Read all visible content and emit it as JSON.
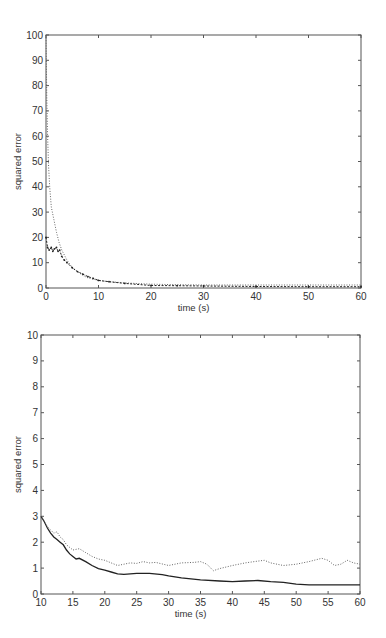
{
  "chart_data": [
    {
      "type": "line",
      "title": "",
      "xlabel": "time (s)",
      "ylabel": "squared error",
      "xlim": [
        0,
        60
      ],
      "ylim": [
        0,
        100
      ],
      "xticks": [
        0,
        10,
        20,
        30,
        40,
        50,
        60
      ],
      "yticks": [
        0,
        10,
        20,
        30,
        40,
        50,
        60,
        70,
        80,
        90,
        100
      ],
      "grid": false,
      "legend": null,
      "series": [
        {
          "name": "dotted",
          "style": "dotted",
          "x": [
            0,
            0.15,
            0.3,
            0.5,
            0.7,
            1,
            1.5,
            2,
            2.5,
            3,
            4,
            5,
            6,
            7,
            8,
            10,
            12,
            15,
            20,
            25,
            30,
            40,
            50,
            60
          ],
          "y": [
            100,
            75,
            60,
            48,
            40,
            32,
            27,
            22,
            18,
            15,
            11,
            8,
            6.5,
            5,
            4,
            3,
            2.5,
            2,
            1.5,
            1.3,
            1.2,
            1.2,
            1.2,
            1.2
          ]
        },
        {
          "name": "solid-markers",
          "style": "solid-markers",
          "x": [
            0,
            0.3,
            0.6,
            1,
            1.3,
            1.6,
            2,
            2.3,
            2.6,
            3,
            3.5,
            4,
            5,
            6,
            7,
            8,
            9,
            10,
            12,
            15,
            20,
            25,
            30,
            40,
            50,
            60
          ],
          "y": [
            20,
            16,
            15,
            16,
            14.5,
            15.5,
            16,
            14.5,
            15,
            12.5,
            11,
            10,
            8,
            6.5,
            5.5,
            4.5,
            3.8,
            3,
            2.5,
            1.8,
            1,
            0.9,
            0.8,
            0.6,
            0.5,
            0.5
          ]
        }
      ]
    },
    {
      "type": "line",
      "title": "",
      "xlabel": "time (s)",
      "ylabel": "squared error",
      "xlim": [
        10,
        60
      ],
      "ylim": [
        0,
        10
      ],
      "xticks": [
        10,
        15,
        20,
        25,
        30,
        35,
        40,
        45,
        50,
        55,
        60
      ],
      "yticks": [
        0,
        1,
        2,
        3,
        4,
        5,
        6,
        7,
        8,
        9,
        10
      ],
      "grid": false,
      "legend": null,
      "series": [
        {
          "name": "solid",
          "style": "solid",
          "x": [
            10,
            10.5,
            11,
            11.5,
            12,
            12.5,
            13,
            13.5,
            14,
            14.5,
            15,
            15.5,
            16,
            17,
            18,
            19,
            20,
            21,
            22,
            23,
            25,
            27,
            29,
            30,
            32,
            35,
            38,
            40,
            42,
            44,
            46,
            48,
            50,
            52,
            55,
            58,
            60
          ],
          "y": [
            3.0,
            2.8,
            2.55,
            2.35,
            2.2,
            2.1,
            2.0,
            1.9,
            1.7,
            1.55,
            1.45,
            1.35,
            1.38,
            1.25,
            1.1,
            0.98,
            0.92,
            0.85,
            0.78,
            0.76,
            0.8,
            0.8,
            0.75,
            0.7,
            0.62,
            0.55,
            0.5,
            0.48,
            0.5,
            0.52,
            0.48,
            0.45,
            0.38,
            0.35,
            0.35,
            0.35,
            0.35
          ]
        },
        {
          "name": "dotted",
          "style": "dotted",
          "x": [
            10,
            11,
            12,
            12.5,
            13,
            13.5,
            14,
            15,
            16,
            17,
            18,
            19,
            20,
            21,
            22,
            23,
            24,
            25,
            26,
            27,
            28,
            30,
            32,
            34,
            35,
            36,
            37,
            38,
            40,
            42,
            44,
            45,
            46,
            48,
            50,
            52,
            54,
            55,
            56,
            57,
            58,
            59,
            60
          ],
          "y": [
            3.0,
            2.6,
            2.35,
            2.4,
            2.2,
            2.1,
            1.9,
            1.7,
            1.75,
            1.6,
            1.45,
            1.35,
            1.3,
            1.2,
            1.1,
            1.15,
            1.2,
            1.18,
            1.25,
            1.2,
            1.22,
            1.1,
            1.2,
            1.22,
            1.25,
            1.15,
            0.9,
            0.98,
            1.1,
            1.2,
            1.27,
            1.3,
            1.2,
            1.1,
            1.15,
            1.25,
            1.38,
            1.3,
            1.1,
            1.15,
            1.3,
            1.2,
            1.15
          ]
        }
      ]
    }
  ]
}
